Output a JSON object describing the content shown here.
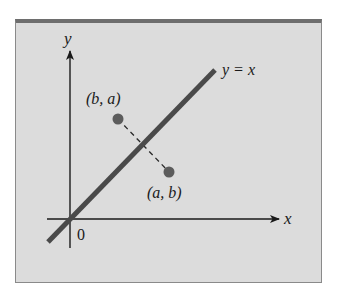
{
  "diagram": {
    "colors": {
      "background": "#dcdcdc",
      "frame_top": "#6e6e6e",
      "frame_border": "#8a8a8a",
      "line": "#4a4a4a",
      "axes": "#1a1a1a",
      "points": "#5c5c5c"
    },
    "axes": {
      "x_label": "x",
      "y_label": "y",
      "origin_label": "0"
    },
    "line": {
      "label": "y = x"
    },
    "points": [
      {
        "label": "(b, a)",
        "role": "reflected-point"
      },
      {
        "label": "(a, b)",
        "role": "original-point"
      }
    ],
    "connector": "dashed segment between (a, b) and (b, a), perpendicular to y = x"
  }
}
